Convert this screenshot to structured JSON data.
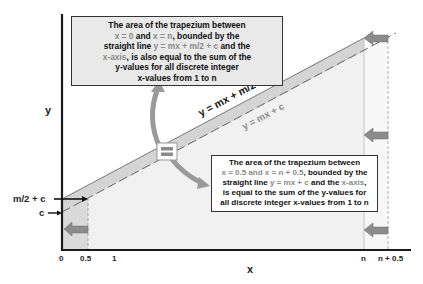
{
  "axes": {
    "x_label": "x",
    "y_label": "y",
    "x_ticks": [
      "0",
      "0.5",
      "1",
      "n",
      "n + 0.5"
    ],
    "y_ticks": [
      "m/2 + c",
      "c"
    ]
  },
  "lines": {
    "upper": "y = mx + m/2 + c",
    "lower": "y = mx + c"
  },
  "top_box": {
    "line1": "The area of the trapezium between",
    "line2_a": "x = 0",
    "line2_b": " and ",
    "line2_c": "x = n",
    "line2_d": ", bounded by the",
    "line3_a": "straight line ",
    "line3_b": "y = mx + m/2 + c",
    "line3_c": " and the",
    "line4_a": "x-axis",
    "line4_b": ", is also equal to the sum of the",
    "line5": "y-values for all discrete integer",
    "line6": "x-values from 1 to n"
  },
  "bottom_box": {
    "line1": "The area of the trapezium between",
    "line2_a": "x = 0.5",
    "line2_b": " and ",
    "line2_c": "x = n + 0.5",
    "line2_d": ", bounded by the",
    "line3_a": "straight line ",
    "line3_b": "y = mx + c",
    "line3_c": " and the ",
    "line3_d": "x-axis",
    "line3_e": ",",
    "line4": "is equal to the sum of the y-values for",
    "line5": "all discrete integer x-values from 1 to n"
  },
  "colors": {
    "axis": "#1a1a1a",
    "band_fill": "#d6d6d6",
    "area_fill": "#f0f0f0",
    "left_strip_fill": "#dcdcdc",
    "arrow_fill": "#8c8c8c",
    "curved_arrow": "#9a9a9a",
    "equals_icon": "#8a8a8a",
    "highlight_text": "#8a8a8a"
  }
}
